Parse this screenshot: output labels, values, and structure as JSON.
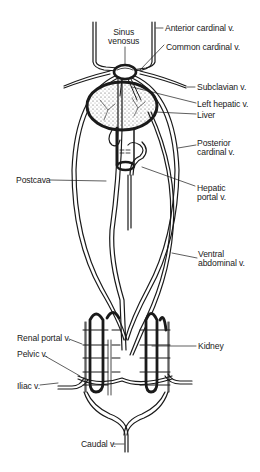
{
  "diagram": {
    "type": "anatomical line drawing",
    "labels": {
      "sinus_venosus_1": "Sinus",
      "sinus_venosus_2": "venosus",
      "anterior_cardinal": "Anterior cardinal v.",
      "common_cardinal": "Common cardinal v.",
      "subclavian": "Subclavian v.",
      "left_hepatic": "Left hepatic v.",
      "liver": "Liver",
      "posterior_cardinal_1": "Posterior",
      "posterior_cardinal_2": "cardinal v.",
      "postcava": "Postcava",
      "hepatic_portal_1": "Hepatic",
      "hepatic_portal_2": "portal v.",
      "ventral_abdominal_1": "Ventral",
      "ventral_abdominal_2": "abdominal v.",
      "renal_portal": "Renal portal v.",
      "kidney": "Kidney",
      "pelvic": "Pelvic v.",
      "iliac": "Iliac v.",
      "caudal": "Caudal v."
    },
    "colors": {
      "line": "#1a1a1a",
      "background": "#ffffff",
      "liver_fill": "#e8e8e8"
    }
  }
}
